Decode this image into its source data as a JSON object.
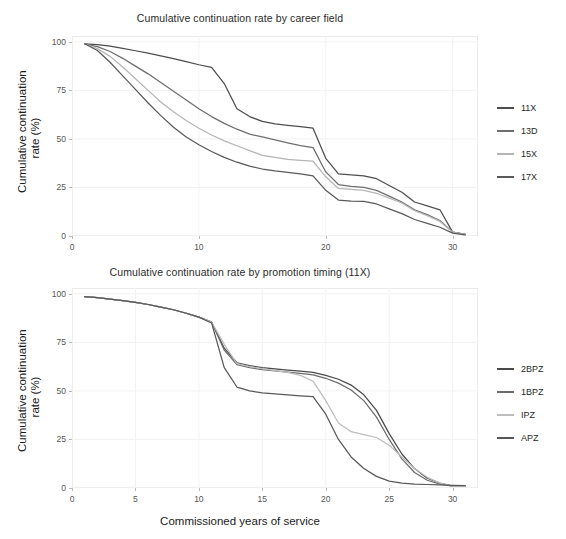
{
  "figure": {
    "xlabel": "Commissioned years of service",
    "ylabel_line1": "Cumulative continuation",
    "ylabel_line2": "rate (%)",
    "background": "#ffffff",
    "panel_border": "#d6d6d6",
    "grid_color": "#f2f2f2"
  },
  "chart_data": [
    {
      "type": "line",
      "title": "Cumulative continuation rate by career field",
      "xlabel": "",
      "ylabel": "Cumulative continuation rate (%)",
      "xlim": [
        0,
        32
      ],
      "ylim": [
        0,
        103
      ],
      "xticks": [
        0,
        10,
        20,
        30
      ],
      "yticks": [
        0,
        25,
        50,
        75,
        100
      ],
      "grid": true,
      "legend_position": "right",
      "x": [
        1,
        2,
        3,
        4,
        5,
        6,
        7,
        8,
        9,
        10,
        11,
        12,
        13,
        14,
        15,
        16,
        17,
        18,
        19,
        20,
        21,
        22,
        23,
        24,
        25,
        26,
        27,
        28,
        29,
        30,
        31
      ],
      "series": [
        {
          "name": "11X",
          "color": "#4d4d4d",
          "values": [
            99,
            98.6,
            97.8,
            96.6,
            95.4,
            94.2,
            92.8,
            91.4,
            89.8,
            88.2,
            86.8,
            78.5,
            65.5,
            61.5,
            59.0,
            57.8,
            57.0,
            56.3,
            55.5,
            40.0,
            32.0,
            31.5,
            31.0,
            29.5,
            26.0,
            22.5,
            17.5,
            15.5,
            13.5,
            2.0,
            0.8
          ]
        },
        {
          "name": "13D",
          "color": "#6e6e6e",
          "values": [
            99,
            97.5,
            95.0,
            91.5,
            87.5,
            83.5,
            79.0,
            74.5,
            70.0,
            65.5,
            61.5,
            58.0,
            55.0,
            52.5,
            51.0,
            49.5,
            48.0,
            46.5,
            45.5,
            33.0,
            26.5,
            25.5,
            25.0,
            23.5,
            20.5,
            17.5,
            13.5,
            11.0,
            8.0,
            2.0,
            0.8
          ]
        },
        {
          "name": "15X",
          "color": "#b5b5b5",
          "values": [
            99,
            96.5,
            92.5,
            87.0,
            81.0,
            75.0,
            69.0,
            64.0,
            59.5,
            55.5,
            52.0,
            49.0,
            46.5,
            44.0,
            41.5,
            40.5,
            39.5,
            39.0,
            38.5,
            30.5,
            24.5,
            24.0,
            23.5,
            22.0,
            19.5,
            17.0,
            13.0,
            10.5,
            7.5,
            2.0,
            0.8
          ]
        },
        {
          "name": "17X",
          "color": "#595959",
          "values": [
            99,
            95.5,
            89.5,
            82.5,
            75.5,
            68.5,
            62.0,
            56.0,
            51.0,
            47.0,
            43.5,
            40.5,
            38.0,
            36.0,
            34.5,
            33.5,
            32.8,
            32.0,
            31.0,
            23.5,
            18.5,
            18.0,
            17.8,
            16.5,
            14.0,
            11.5,
            8.5,
            6.5,
            4.5,
            1.5,
            0.6
          ]
        }
      ]
    },
    {
      "type": "line",
      "title": "Cumulative continuation rate by promotion timing (11X)",
      "xlabel": "Commissioned years of service",
      "ylabel": "Cumulative continuation rate (%)",
      "xlim": [
        0,
        32
      ],
      "ylim": [
        0,
        103
      ],
      "xticks": [
        0,
        5,
        10,
        15,
        20,
        25,
        30
      ],
      "yticks": [
        0,
        25,
        50,
        75,
        100
      ],
      "grid": true,
      "legend_position": "right",
      "x": [
        1,
        2,
        3,
        4,
        5,
        6,
        7,
        8,
        9,
        10,
        11,
        12,
        13,
        14,
        15,
        16,
        17,
        18,
        19,
        20,
        21,
        22,
        23,
        24,
        25,
        26,
        27,
        28,
        29,
        30,
        31
      ],
      "series": [
        {
          "name": "2BPZ",
          "color": "#4a4a4a",
          "values": [
            98.5,
            98.0,
            97.3,
            96.5,
            95.6,
            94.5,
            93.2,
            91.8,
            90.0,
            88.0,
            85.5,
            72.0,
            64.5,
            63.0,
            62.0,
            61.3,
            60.7,
            60.2,
            59.5,
            58.0,
            56.0,
            53.0,
            48.0,
            40.0,
            28.0,
            17.5,
            10.0,
            5.0,
            2.5,
            1.0,
            0.8
          ]
        },
        {
          "name": "1BPZ",
          "color": "#6b6b6b",
          "values": [
            98.5,
            98.0,
            97.3,
            96.5,
            95.6,
            94.5,
            93.2,
            91.8,
            90.0,
            88.0,
            85.5,
            71.0,
            63.5,
            62.0,
            61.0,
            60.3,
            59.7,
            59.0,
            58.3,
            56.5,
            54.0,
            50.5,
            45.0,
            36.5,
            25.0,
            15.0,
            8.0,
            4.0,
            2.0,
            1.0,
            0.8
          ]
        },
        {
          "name": "IPZ",
          "color": "#bdbdbd",
          "values": [
            98.5,
            98.0,
            97.3,
            96.5,
            95.6,
            94.5,
            93.2,
            91.8,
            90.0,
            88.0,
            85.5,
            74.0,
            64.0,
            62.5,
            61.5,
            60.5,
            59.5,
            58.0,
            55.0,
            45.0,
            33.5,
            29.0,
            27.5,
            26.0,
            22.0,
            16.0,
            10.0,
            5.5,
            2.5,
            1.0,
            0.8
          ]
        },
        {
          "name": "APZ",
          "color": "#585858",
          "values": [
            98.5,
            98.0,
            97.3,
            96.5,
            95.6,
            94.5,
            93.2,
            91.8,
            90.0,
            88.0,
            85.0,
            62.0,
            52.0,
            50.0,
            49.0,
            48.5,
            48.0,
            47.5,
            47.0,
            38.0,
            25.0,
            16.0,
            10.0,
            6.0,
            3.5,
            2.5,
            2.0,
            1.8,
            1.6,
            1.4,
            1.2
          ]
        }
      ]
    }
  ],
  "legends": [
    {
      "items": [
        {
          "label": "11X",
          "color": "#4d4d4d"
        },
        {
          "label": "13D",
          "color": "#6e6e6e"
        },
        {
          "label": "15X",
          "color": "#b5b5b5"
        },
        {
          "label": "17X",
          "color": "#595959"
        }
      ]
    },
    {
      "items": [
        {
          "label": "2BPZ",
          "color": "#4a4a4a"
        },
        {
          "label": "1BPZ",
          "color": "#6b6b6b"
        },
        {
          "label": "IPZ",
          "color": "#bdbdbd"
        },
        {
          "label": "APZ",
          "color": "#585858"
        }
      ]
    }
  ]
}
